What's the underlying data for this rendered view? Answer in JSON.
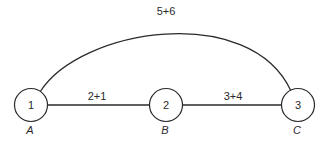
{
  "diagram": {
    "type": "graph",
    "nodes": [
      {
        "id": "1",
        "number": "1",
        "letter": "A"
      },
      {
        "id": "2",
        "number": "2",
        "letter": "B"
      },
      {
        "id": "3",
        "number": "3",
        "letter": "C"
      }
    ],
    "edges": [
      {
        "from": "1",
        "to": "2",
        "label": "2+1",
        "shape": "straight"
      },
      {
        "from": "2",
        "to": "3",
        "label": "3+4",
        "shape": "straight"
      },
      {
        "from": "1",
        "to": "3",
        "label": "5+6",
        "shape": "arc"
      }
    ]
  }
}
